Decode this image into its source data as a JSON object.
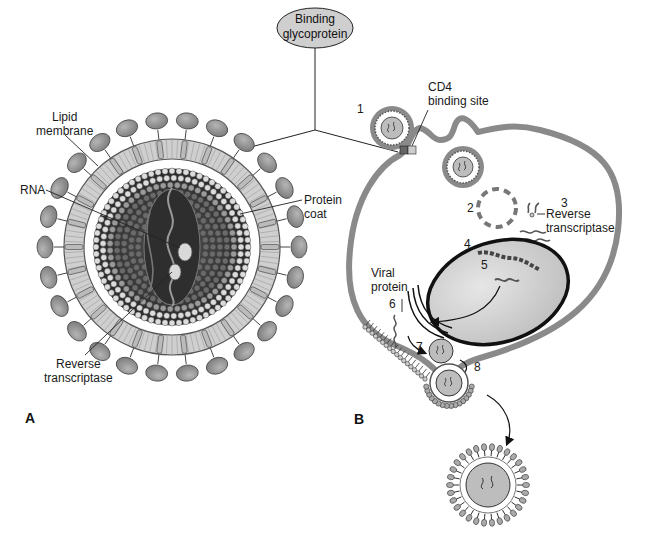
{
  "figure": {
    "colors": {
      "envelope": "#c9c9c9",
      "glycoprotein": "#8e8e8e",
      "core_dark": "#3a3a3a",
      "bead": "#d8d8d8",
      "cell_membrane": "#8a8a8a",
      "nucleus": "#d4d4d4",
      "outline": "#111111"
    },
    "callout": {
      "label_line1": "Binding",
      "label_line2": "glycoprotein"
    },
    "panel_a": {
      "letter": "A",
      "labels": {
        "lipid_membrane_1": "Lipid",
        "lipid_membrane_2": "membrane",
        "rna": "RNA",
        "protein_coat_1": "Protein",
        "protein_coat_2": "coat",
        "reverse_transcriptase_1": "Reverse",
        "reverse_transcriptase_2": "transcriptase"
      }
    },
    "panel_b": {
      "letter": "B",
      "labels": {
        "cd4_1": "CD4",
        "cd4_2": "binding site",
        "reverse_transcriptase_1": "Reverse",
        "reverse_transcriptase_2": "transcriptase",
        "viral_protein_1": "Viral",
        "viral_protein_2": "protein"
      },
      "steps": [
        "1",
        "2",
        "3",
        "4",
        "5",
        "6",
        "7",
        "8"
      ]
    }
  }
}
